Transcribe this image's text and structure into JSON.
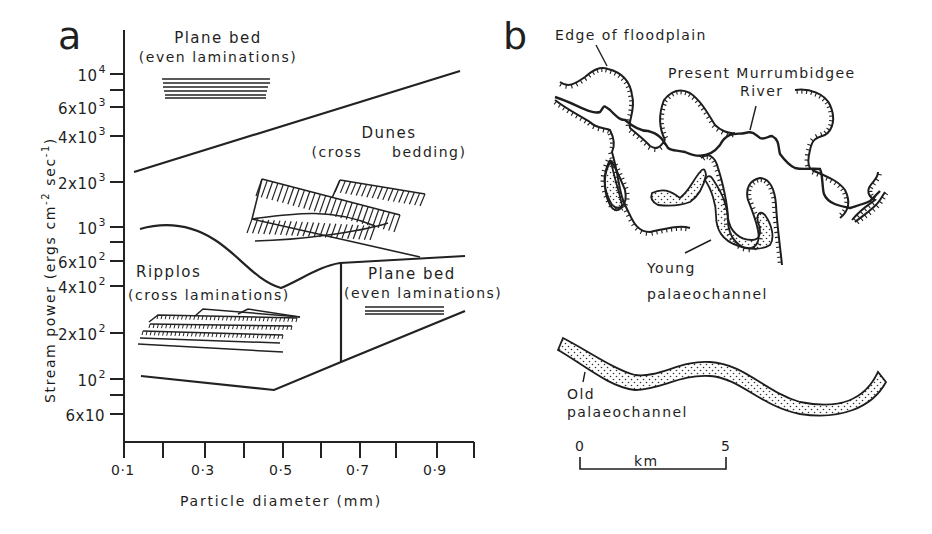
{
  "figure": {
    "panel_a": {
      "letter": "a",
      "y_axis_title": "Stream power (ergs cm",
      "y_axis_title_sup1": "-2",
      "y_axis_title_mid": " sec",
      "y_axis_title_sup2": "-1",
      "y_axis_title_end": ")",
      "x_axis_title": "Particle diameter (mm)",
      "x_ticks": [
        "0·1",
        "0·3",
        "0·5",
        "0·7",
        "0·9"
      ],
      "y_ticks": [
        {
          "base": "10",
          "exp": "4"
        },
        {
          "base": "6x10",
          "exp": "3"
        },
        {
          "base": "4x10",
          "exp": "3"
        },
        {
          "base": "2x10",
          "exp": "3"
        },
        {
          "base": "10",
          "exp": "3"
        },
        {
          "base": "6x10",
          "exp": "2"
        },
        {
          "base": "4x10",
          "exp": "2"
        },
        {
          "base": "2x10",
          "exp": "2"
        },
        {
          "base": "10",
          "exp": "2"
        },
        {
          "base": "6x10",
          "exp": ""
        }
      ],
      "regions": {
        "plane_bed_upper": {
          "title": "Plane bed",
          "subtitle": "(even laminations)"
        },
        "dunes": {
          "title": "Dunes",
          "subtitle": "(cross     bedding)"
        },
        "ripples": {
          "title": "Ripplos",
          "subtitle": "(cross laminations)"
        },
        "plane_bed_lower": {
          "title": "Plane bed",
          "subtitle": "(even laminations)"
        }
      }
    },
    "panel_b": {
      "letter": "b",
      "labels": {
        "floodplain": "Edge of floodplain",
        "river_line1": "Present Murrumbidgee",
        "river_line2": "River",
        "young_line1": "Young",
        "young_line2": "palaeochannel",
        "old_line1": "Old",
        "old_line2": "palaeochannel"
      },
      "scale_bar": {
        "start": "0",
        "end": "5",
        "unit": "km"
      }
    }
  },
  "chart_data": {
    "type": "bed-form phase diagram",
    "title": "",
    "xlabel": "Particle diameter (mm)",
    "ylabel": "Stream power (ergs cm-2 sec-1)",
    "x_scale": "linear",
    "y_scale": "log",
    "xlim": [
      0.1,
      1.0
    ],
    "ylim": [
      50,
      15000
    ],
    "x_tick_labels": [
      "0.1",
      "0.3",
      "0.5",
      "0.7",
      "0.9"
    ],
    "y_tick_labels": [
      "10^4",
      "6x10^3",
      "4x10^3",
      "2x10^3",
      "10^3",
      "6x10^2",
      "4x10^2",
      "2x10^2",
      "10^2",
      "6x10"
    ],
    "boundaries": [
      {
        "name": "upper plane bed / dunes boundary",
        "points": [
          [
            0.11,
            2400
          ],
          [
            0.3,
            3600
          ],
          [
            0.5,
            5000
          ],
          [
            0.7,
            7000
          ],
          [
            0.97,
            10500
          ]
        ]
      },
      {
        "name": "dunes / ripples & lower plane bed boundary",
        "points": [
          [
            0.14,
            1000
          ],
          [
            0.2,
            1000
          ],
          [
            0.3,
            750
          ],
          [
            0.4,
            460
          ],
          [
            0.5,
            390
          ],
          [
            0.6,
            520
          ],
          [
            0.65,
            620
          ],
          [
            0.75,
            630
          ],
          [
            0.97,
            650
          ]
        ]
      },
      {
        "name": "ripples / lower plane bed divider",
        "points": [
          [
            0.65,
            620
          ],
          [
            0.65,
            120
          ]
        ]
      },
      {
        "name": "lower limit of bed motion",
        "points": [
          [
            0.14,
            105
          ],
          [
            0.3,
            95
          ],
          [
            0.47,
            88
          ],
          [
            0.5,
            90
          ],
          [
            0.65,
            120
          ],
          [
            0.97,
            280
          ]
        ]
      }
    ],
    "regions": [
      {
        "name": "Plane bed (even laminations)",
        "position": "upper, above ~2x10^3–10^4"
      },
      {
        "name": "Dunes (cross bedding)",
        "position": "middle, ~10^3–5x10^3"
      },
      {
        "name": "Ripples (cross laminations)",
        "position": "lower-left, 0.1–0.65 mm"
      },
      {
        "name": "Plane bed (even laminations)",
        "position": "lower-right, >0.65 mm"
      }
    ],
    "grid": false,
    "legend": null
  }
}
